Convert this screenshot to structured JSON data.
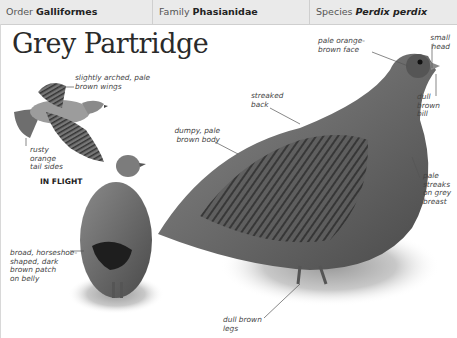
{
  "header": {
    "order": {
      "label": "Order",
      "value": "Galliformes"
    },
    "family": {
      "label": "Family",
      "value": "Phasianidae"
    },
    "species": {
      "label": "Species",
      "value": "Perdix perdix"
    }
  },
  "title": "Grey Partridge",
  "flight_caption": "IN FLIGHT",
  "annotations": {
    "wings": [
      "slightly arched, pale",
      "brown wings"
    ],
    "tail": [
      "rusty",
      "orange",
      "tail sides"
    ],
    "belly": [
      "broad, horseshoe-",
      "shaped, dark",
      "brown patch",
      "on belly"
    ],
    "body": [
      "dumpy, pale",
      "brown body"
    ],
    "back": [
      "streaked",
      "back"
    ],
    "face": [
      "pale orange-",
      "brown face"
    ],
    "head": [
      "small",
      "head"
    ],
    "bill": [
      "dull",
      "brown",
      "bill"
    ],
    "breast": [
      "pale",
      "streaks",
      "on grey",
      "breast"
    ],
    "legs": [
      "dull brown",
      "legs"
    ]
  },
  "colors": {
    "header_bg": "#eaeaea",
    "text": "#444444",
    "bird_grey": "#7a7a7a",
    "bird_dark": "#3a3a3a"
  }
}
